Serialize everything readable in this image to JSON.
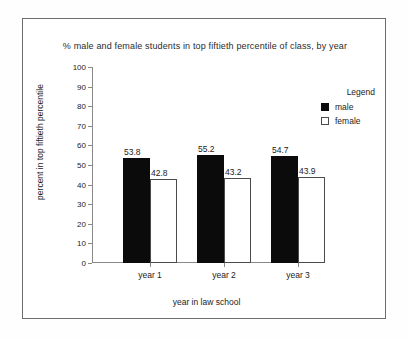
{
  "chart_data": {
    "type": "bar",
    "title": "% male and female students in top fiftieth percentile of class, by year",
    "xlabel": "year in law school",
    "ylabel": "percent in top fiftieth percentile",
    "categories": [
      "year 1",
      "year 2",
      "year 3"
    ],
    "series": [
      {
        "name": "male",
        "color": "#0b0b0b",
        "values": [
          53.8,
          55.2,
          54.7
        ]
      },
      {
        "name": "female",
        "color": "#ffffff",
        "values": [
          42.8,
          43.2,
          43.9
        ]
      }
    ],
    "ylim": [
      0,
      100
    ],
    "ytick_labels": [
      "100",
      "90",
      "80",
      "70",
      "60",
      "50",
      "40",
      "30",
      "20",
      "10",
      "0"
    ],
    "ytick_values": [
      100,
      90,
      80,
      70,
      60,
      50,
      40,
      30,
      20,
      10,
      0
    ],
    "grid": false,
    "legend": {
      "title": "Legend",
      "position": "right",
      "entries": [
        "male",
        "female"
      ]
    },
    "data_labels": [
      "53.8",
      "42.8",
      "55.2",
      "43.2",
      "54.7",
      "43.9"
    ]
  }
}
